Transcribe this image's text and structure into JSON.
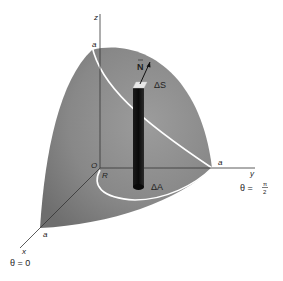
{
  "diagram": {
    "type": "3d-surface-projection",
    "colors": {
      "surface": "#8a8a8a",
      "surface_light": "#a8a8a8",
      "column": "#111111",
      "curve": "#ffffff",
      "axis": "#333333",
      "background": "#ffffff"
    },
    "axes": {
      "z": {
        "label": "z",
        "intercept_label": "a"
      },
      "y": {
        "label": "y",
        "intercept_label": "a",
        "angle_label": "θ = π/2"
      },
      "x": {
        "label": "x",
        "intercept_label": "a",
        "angle_label": "θ = 0"
      }
    },
    "origin_label": "O",
    "region_label": "R",
    "column": {
      "top_label": "ΔS",
      "bottom_label": "ΔA",
      "normal_label": "N"
    },
    "angle_labels": {
      "theta_zero": "θ = 0",
      "theta_half_pi_prefix": "θ =",
      "pi": "π",
      "two": "2"
    }
  }
}
